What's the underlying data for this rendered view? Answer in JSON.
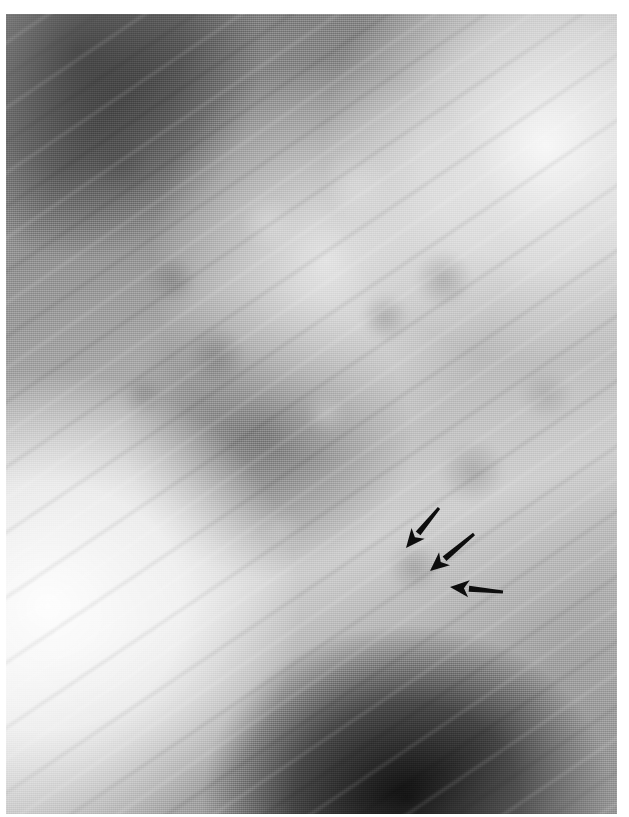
{
  "figure": {
    "kind": "radiograph",
    "modality": "chest-tomogram",
    "orientation": "portrait",
    "caption": "",
    "plate": {
      "x": 6,
      "y": 14,
      "width": 611,
      "height": 800,
      "border_color": "#ffffff",
      "background_color": "#8d8d8d"
    },
    "tones": {
      "darkest": "#1c1c1c",
      "dark": "#4d4d4d",
      "mid": "#8d8d8d",
      "light": "#cfcfcf",
      "lightest": "#f6f6f6"
    },
    "regions": [
      {
        "name": "upper-left-lung-field",
        "tone": "dark"
      },
      {
        "name": "upper-right-lung-field",
        "tone": "light"
      },
      {
        "name": "central-mediastinum",
        "tone": "light"
      },
      {
        "name": "hilar-nodular-opacities",
        "tone": "mid"
      },
      {
        "name": "lower-left-field",
        "tone": "lightest"
      },
      {
        "name": "basal-diaphragm-shadow",
        "tone": "darkest"
      }
    ]
  },
  "annotations": {
    "color": "#0d0d0d",
    "count": 3,
    "label": "arrow markers indicating lesion",
    "arrows": [
      {
        "id": "arrow-1",
        "tail_x": 439,
        "tail_y": 508,
        "tip_x": 406,
        "tip_y": 548,
        "angle_deg": 230,
        "length": 52
      },
      {
        "id": "arrow-2",
        "tail_x": 474,
        "tail_y": 534,
        "tip_x": 430,
        "tip_y": 571,
        "angle_deg": 220,
        "length": 58
      },
      {
        "id": "arrow-3",
        "tail_x": 503,
        "tail_y": 592,
        "tip_x": 450,
        "tip_y": 587,
        "angle_deg": 185,
        "length": 53
      }
    ]
  }
}
